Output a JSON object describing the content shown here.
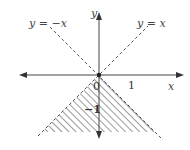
{
  "figure": {
    "type": "coordinate-plane-inequality",
    "axes": {
      "x_label": "x",
      "y_label": "y",
      "origin_label": "0",
      "x_tick_label": "1",
      "y_tick_label": "−1"
    },
    "lines": [
      {
        "label": "y = −x",
        "style": "dashed"
      },
      {
        "label": "y = x",
        "style": "dashed"
      }
    ],
    "shaded_region": {
      "description": "Region below both lines y = x and y = −x (y < −|x|)",
      "pattern": "diagonal-hatch"
    },
    "colors": {
      "axis": "#333333",
      "dashed_line": "#555555",
      "hatch": "#9a9a9a",
      "text": "#444444"
    }
  }
}
